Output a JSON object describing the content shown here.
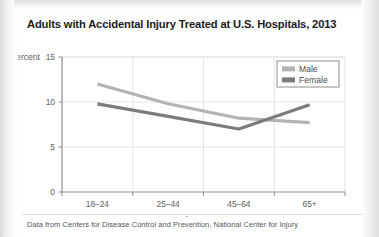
{
  "page": {
    "title": "Adults with Accidental Injury Treated at U.S. Hospitals, 2013",
    "caption": "Data from Centers for Disease Control and Prevention, National Center for Injury"
  },
  "chart_data": {
    "type": "line",
    "title": "Adults with Accidental Injury Treated at U.S. Hospitals, 2013",
    "categories": [
      "18–24",
      "25–44",
      "45–64",
      "65+"
    ],
    "series": [
      {
        "name": "Male",
        "values": [
          12.0,
          9.8,
          8.2,
          7.7
        ],
        "color": "#b3b3b3"
      },
      {
        "name": "Female",
        "values": [
          9.8,
          8.4,
          7.0,
          9.7
        ],
        "color": "#7c7c7c"
      }
    ],
    "xlabel": "Age group",
    "ylabel": "Percent",
    "ylim": [
      0,
      15
    ],
    "yticks": [
      0,
      5,
      10,
      15
    ],
    "ytick_labels": [
      "0",
      "5",
      "10",
      "15"
    ],
    "grid": true,
    "legend_position": "top-right"
  }
}
